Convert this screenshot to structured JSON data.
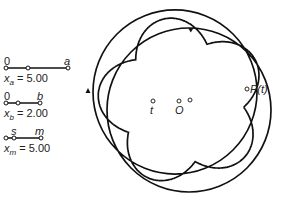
{
  "sliders": [
    {
      "left_label": "0",
      "right_label": "a",
      "var": "x",
      "sub": "a",
      "eq": "= 5.00",
      "value": 5.0
    },
    {
      "left_label": "0",
      "right_label": "b",
      "var": "x",
      "sub": "b",
      "eq": "= 2.00",
      "value": 2.0
    },
    {
      "left_label": "s",
      "right_label": "m",
      "var": "x",
      "sub": "m",
      "eq": "= 5.00",
      "value": 5.0
    }
  ],
  "points": {
    "t": "t",
    "O": "O",
    "P": "P(t)"
  },
  "colors": {
    "stroke": "#111111",
    "text": "#222222"
  }
}
